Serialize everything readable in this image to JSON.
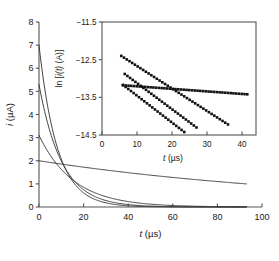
{
  "figure": {
    "background_color": "#ffffff",
    "line_color": "#3a3a3a",
    "marker_color": "#111111",
    "axis_color": "#555555"
  },
  "chart_data": {
    "type": "line",
    "title": "",
    "subtitle": "",
    "xlabel": "t (µs)",
    "xlabel_italic_part": "t",
    "xlabel_unit_part": " (µs)",
    "ylabel": "i (µA)",
    "ylabel_italic_part": "i",
    "ylabel_unit_part": " (µA)",
    "xlim": [
      0,
      100
    ],
    "ylim": [
      0,
      8
    ],
    "xticks": [
      0,
      20,
      40,
      60,
      80,
      100
    ],
    "xticklabels": [
      "0",
      "20",
      "40",
      "60",
      "80",
      "100"
    ],
    "yticks": [
      0,
      1,
      2,
      3,
      4,
      5,
      6,
      7,
      8
    ],
    "yticklabels": [
      "0",
      "1",
      "2",
      "3",
      "4",
      "5",
      "6",
      "7",
      "8"
    ],
    "grid": false,
    "legend": null,
    "series": [
      {
        "name": "decay-1-fastest",
        "i0": 7.0,
        "tau": 8.2,
        "t_end": 93,
        "x": [
          0,
          2,
          4,
          6,
          8,
          10,
          12,
          14,
          16,
          18,
          20,
          24,
          28,
          32,
          36,
          40,
          46,
          52,
          60,
          70,
          80,
          93
        ],
        "y": [
          7.0,
          5.48,
          4.29,
          3.36,
          2.63,
          2.06,
          1.61,
          1.26,
          0.99,
          0.77,
          0.61,
          0.37,
          0.23,
          0.14,
          0.085,
          0.052,
          0.025,
          0.012,
          0.0043,
          0.0012,
          0.00035,
          6e-05
        ]
      },
      {
        "name": "decay-2",
        "i0": 5.3,
        "tau": 10.2,
        "t_end": 93,
        "x": [
          0,
          2,
          4,
          6,
          8,
          10,
          12,
          14,
          16,
          18,
          20,
          24,
          28,
          32,
          36,
          40,
          46,
          52,
          60,
          70,
          80,
          93
        ],
        "y": [
          5.3,
          4.36,
          3.58,
          2.95,
          2.42,
          1.99,
          1.64,
          1.35,
          1.11,
          0.91,
          0.75,
          0.51,
          0.34,
          0.23,
          0.155,
          0.104,
          0.057,
          0.032,
          0.014,
          0.005,
          0.0018,
          0.0005
        ]
      },
      {
        "name": "decay-3",
        "i0": 3.1,
        "tau": 15.5,
        "t_end": 93,
        "x": [
          0,
          2,
          4,
          6,
          8,
          10,
          12,
          14,
          16,
          18,
          20,
          24,
          28,
          32,
          36,
          40,
          46,
          52,
          60,
          70,
          80,
          93
        ],
        "y": [
          3.1,
          2.73,
          2.41,
          2.13,
          1.88,
          1.66,
          1.46,
          1.29,
          1.14,
          1.0,
          0.89,
          0.69,
          0.53,
          0.41,
          0.32,
          0.25,
          0.17,
          0.115,
          0.07,
          0.036,
          0.019,
          0.0078
        ]
      },
      {
        "name": "decay-4-slowest",
        "i0": 2.0,
        "tau": 134,
        "t_end": 93,
        "x": [
          0,
          10,
          20,
          30,
          40,
          50,
          60,
          70,
          80,
          93
        ],
        "y": [
          2.0,
          1.86,
          1.72,
          1.6,
          1.49,
          1.38,
          1.28,
          1.19,
          1.11,
          1.0
        ]
      }
    ]
  },
  "inset": {
    "chart_data": {
      "type": "scatter",
      "title": "",
      "xlabel": "t (µs)",
      "xlabel_italic_part": "t",
      "xlabel_unit_part": " (µs)",
      "ylabel": "ln [i(t) (A)]",
      "ylabel_prefix": "ln [",
      "ylabel_italic_i": "i",
      "ylabel_paren_t": "(t)",
      "ylabel_suffix": " (A)]",
      "xlim": [
        0,
        44
      ],
      "ylim": [
        -14.5,
        -11.5
      ],
      "xticks": [
        0,
        10,
        20,
        30,
        40
      ],
      "xticklabels": [
        "0",
        "10",
        "20",
        "30",
        "40"
      ],
      "yticks": [
        -14.5,
        -13.5,
        -12.5,
        -11.5
      ],
      "yticklabels": [
        "−14.5",
        "−13.5",
        "−12.5",
        "−11.5"
      ],
      "grid": false,
      "legend": null,
      "marker": "square",
      "series": [
        {
          "name": "inset-series-1-flat",
          "t_start": 6.0,
          "t_end": 41.5,
          "n_points": 46,
          "y_start": -13.18,
          "y_end": -13.42,
          "slope": -0.00676
        },
        {
          "name": "inset-series-2-steep",
          "t_start": 5.5,
          "t_end": 36.0,
          "n_points": 40,
          "y_start": -12.4,
          "y_end": -14.22,
          "slope": -0.0597
        },
        {
          "name": "inset-series-3-steeper",
          "t_start": 6.5,
          "t_end": 27.0,
          "n_points": 28,
          "y_start": -12.88,
          "y_end": -14.3,
          "slope": -0.0693
        },
        {
          "name": "inset-series-4-steepest",
          "t_start": 6.0,
          "t_end": 23.5,
          "n_points": 24,
          "y_start": -13.17,
          "y_end": -14.42,
          "slope": -0.0714
        }
      ]
    }
  }
}
